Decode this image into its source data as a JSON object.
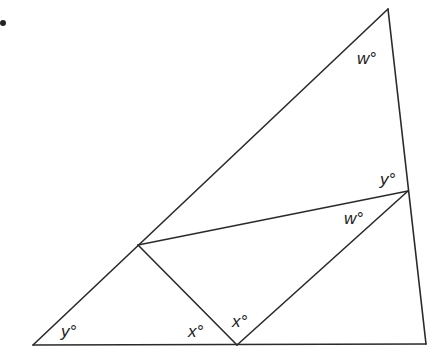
{
  "diagram": {
    "title": "",
    "bullet": "•",
    "stroke_color": "#2a2a2a",
    "points": {
      "A": {
        "x": 388,
        "y": 9
      },
      "B": {
        "x": 408,
        "y": 191
      },
      "C": {
        "x": 426,
        "y": 344
      },
      "D": {
        "x": 237,
        "y": 345
      },
      "E": {
        "x": 33,
        "y": 345
      },
      "F": {
        "x": 138,
        "y": 245
      }
    },
    "segments": [
      [
        "E",
        "A"
      ],
      [
        "A",
        "C"
      ],
      [
        "E",
        "C"
      ],
      [
        "F",
        "B"
      ],
      [
        "F",
        "D"
      ],
      [
        "D",
        "B"
      ]
    ],
    "labels": {
      "w_top": "w°",
      "y_right": "y°",
      "w_mid": "w°",
      "y_left": "y°",
      "x_left": "x°",
      "x_right": "x°"
    }
  }
}
